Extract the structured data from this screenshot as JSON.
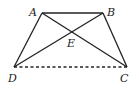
{
  "figure": {
    "points": {
      "A": {
        "label": "A",
        "x": 42,
        "y": 13
      },
      "B": {
        "label": "B",
        "x": 103,
        "y": 13
      },
      "C": {
        "label": "C",
        "x": 127,
        "y": 67
      },
      "D": {
        "label": "D",
        "x": 14,
        "y": 67
      },
      "E": {
        "label": "E",
        "x": 72,
        "y": 33
      }
    },
    "segments": [
      {
        "from": "A",
        "to": "B",
        "style": "solid"
      },
      {
        "from": "A",
        "to": "D",
        "style": "solid"
      },
      {
        "from": "B",
        "to": "C",
        "style": "solid"
      },
      {
        "from": "A",
        "to": "C",
        "style": "solid"
      },
      {
        "from": "B",
        "to": "D",
        "style": "solid"
      },
      {
        "from": "D",
        "to": "C",
        "style": "dashed"
      }
    ],
    "colors": {
      "stroke": "#222222",
      "background": "#ffffff"
    }
  }
}
